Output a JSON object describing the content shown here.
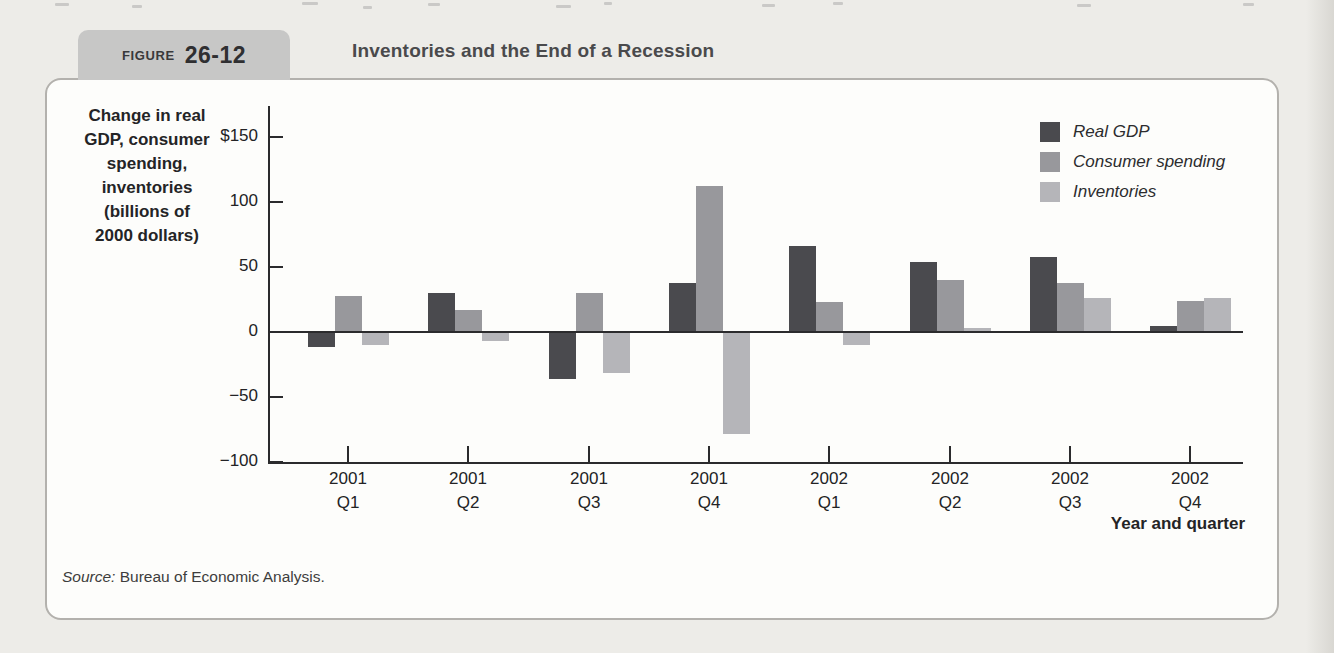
{
  "figure": {
    "label": "FIGURE",
    "number": "26-12",
    "title": "Inventories and the End of a Recession"
  },
  "source": {
    "prefix": "Source:",
    "text": " Bureau of Economic Analysis."
  },
  "chart_data": {
    "type": "bar",
    "title": "Inventories and the End of a Recession",
    "xlabel": "Year and quarter",
    "ylabel": "Change in real GDP, consumer spending, inventories (billions of 2000 dollars)",
    "ylabel_display": "Change in real\nGDP, consumer\nspending,\ninventories\n(billions of\n2000 dollars)",
    "ylim": [
      -100,
      165
    ],
    "grid": false,
    "legend_position": "top-right",
    "categories": [
      [
        "2001",
        "Q1"
      ],
      [
        "2001",
        "Q2"
      ],
      [
        "2001",
        "Q3"
      ],
      [
        "2001",
        "Q4"
      ],
      [
        "2002",
        "Q1"
      ],
      [
        "2002",
        "Q2"
      ],
      [
        "2002",
        "Q3"
      ],
      [
        "2002",
        "Q4"
      ]
    ],
    "y_ticks": [
      {
        "label": "$150",
        "value": 150
      },
      {
        "label": "100",
        "value": 100
      },
      {
        "label": "50",
        "value": 50
      },
      {
        "label": "0",
        "value": 0
      },
      {
        "label": "−50",
        "value": -50
      },
      {
        "label": "−100",
        "value": -100
      }
    ],
    "series": [
      {
        "name": "Real GDP",
        "color": "#4a4a4e",
        "values": [
          -11,
          30,
          -35,
          38,
          66,
          54,
          58,
          5
        ]
      },
      {
        "name": "Consumer spending",
        "color": "#98989c",
        "values": [
          28,
          17,
          30,
          112,
          23,
          40,
          38,
          24
        ]
      },
      {
        "name": "Inventories",
        "color": "#b5b5b9",
        "values": [
          -9,
          -6,
          -31,
          -78,
          -9,
          3,
          26,
          26
        ]
      }
    ]
  }
}
